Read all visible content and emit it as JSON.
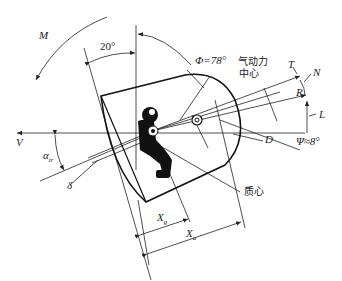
{
  "diagram": {
    "type": "technical-schematic",
    "labels": {
      "moment": "M",
      "tilt_angle": "20°",
      "phi_angle": "Φ=78°",
      "aero_center_line1": "气动力",
      "aero_center_line2": "中心",
      "T": "T",
      "N": "N",
      "R": "R",
      "L": "L",
      "D": "D",
      "psi_angle": "Ψ≈8°",
      "V": "V",
      "alpha": "α",
      "alpha_sub": "tr",
      "delta": "δ",
      "mass_center": "质心",
      "xg": "X",
      "xg_sub": "g",
      "xa": "X",
      "xa_sub": "a"
    },
    "colors": {
      "line": "#222222",
      "background": "#ffffff"
    }
  }
}
